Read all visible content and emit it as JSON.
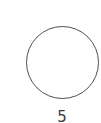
{
  "node": {
    "shape": "circle",
    "fill": "#ffffff",
    "stroke": "#505050"
  },
  "label": {
    "text": "5",
    "color": "#3a3a3a"
  }
}
